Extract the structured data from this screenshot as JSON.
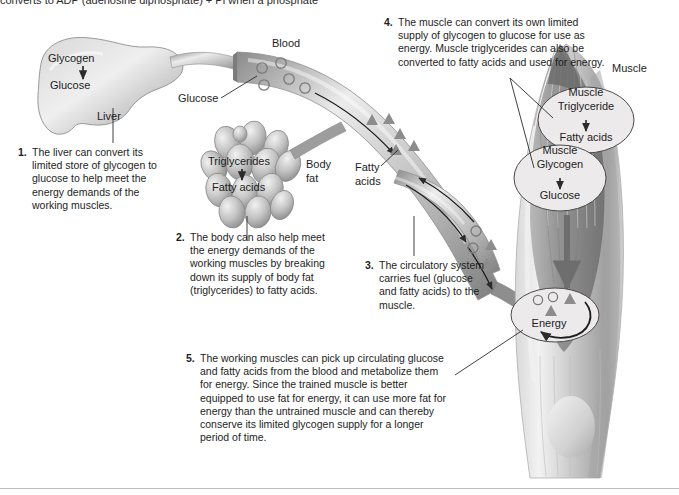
{
  "page": {
    "truncated_header": "converts to ADP (adenosine diphosphate) + Pi when a phosphate"
  },
  "diagram_labels": {
    "liver": "Liver",
    "liver_glycogen": "Glycogen",
    "liver_glucose": "Glucose",
    "blood": "Blood",
    "blood_glucose": "Glucose",
    "body_fat": "Body\nfat",
    "body_fat_line1": "Body",
    "body_fat_line2": "fat",
    "fat_triglycerides": "Triglycerides",
    "fat_fatty_acids": "Fatty acids",
    "vessel_fatty_acids_line1": "Fatty",
    "vessel_fatty_acids_line2": "acids",
    "muscle": "Muscle",
    "muscle_triglyceride_line1": "Muscle",
    "muscle_triglyceride_line2": "Triglyceride",
    "muscle_triglyceride_product": "Fatty acids",
    "muscle_glycogen_line1": "Muscle",
    "muscle_glycogen_line2": "Glycogen",
    "muscle_glycogen_product": "Glucose",
    "energy": "Energy"
  },
  "callouts": [
    {
      "number": "1.",
      "text": "The liver can convert its limited store of glycogen to glucose to help meet the energy demands of the working muscles."
    },
    {
      "number": "2.",
      "text": "The body can also help meet the energy demands of the working muscles by breaking down its supply of body fat (triglycerides) to fatty acids."
    },
    {
      "number": "3.",
      "text": "The circulatory system carries fuel (glucose and fatty acids) to the muscle."
    },
    {
      "number": "4.",
      "text": "The muscle can convert its own limited supply of glycogen to glucose for use as energy. Muscle triglycerides can also be converted to fatty acids and used for energy."
    },
    {
      "number": "5.",
      "text": "The working muscles can pick up circulating glucose and fatty acids from the blood and metabolize them for energy. Since the trained muscle is better equipped to use fat for energy, it can use more fat for energy than the untrained muscle and can thereby conserve its limited glycogen supply for a longer period of time."
    }
  ],
  "symbols": {
    "glucose_symbol": "circle",
    "fatty_acid_symbol": "triangle"
  },
  "colors": {
    "ink": "#1d1d1d",
    "organ_gray": "#a8a8a8",
    "vessel_gray": "#b5b5b5",
    "muscle_gray": "#9a9a9a",
    "rule": "#bdbdbd"
  }
}
